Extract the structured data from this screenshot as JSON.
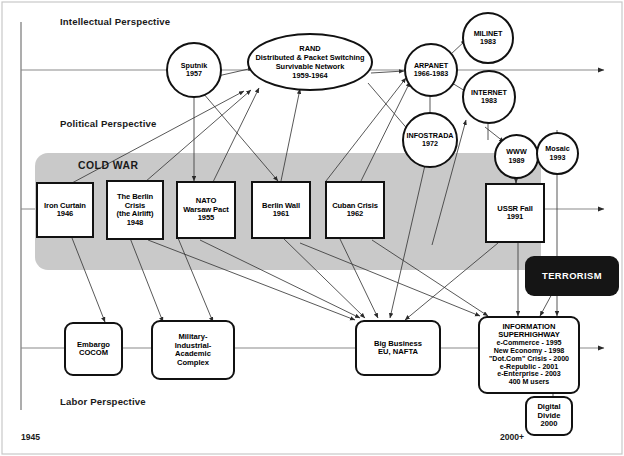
{
  "diagram": {
    "timeline_start": "1945",
    "timeline_end": "2000+",
    "band_label": "COLD WAR",
    "band_color": "#c9c9c9",
    "terrorism_color": "#151515"
  },
  "perspectives": [
    {
      "id": "intellectual",
      "label": "Intellectual Perspective"
    },
    {
      "id": "political",
      "label": "Political Perspective"
    },
    {
      "id": "labor",
      "label": "Labor Perspective"
    }
  ],
  "nodes": {
    "sputnik": {
      "lines": [
        "Sputnik",
        "1957"
      ]
    },
    "rand": {
      "lines": [
        "RAND",
        "Distributed & Packet Switching",
        "Survivable Network",
        "1959-1964"
      ]
    },
    "arpanet": {
      "lines": [
        "ARPANET",
        "1966-1983"
      ]
    },
    "milinet": {
      "lines": [
        "MILINET",
        "1983"
      ]
    },
    "internet": {
      "lines": [
        "INTERNET",
        "1983"
      ]
    },
    "infostrada": {
      "lines": [
        "INFOSTRADA",
        "1972"
      ]
    },
    "www": {
      "lines": [
        "WWW",
        "1989"
      ]
    },
    "mosaic": {
      "lines": [
        "Mosaic",
        "1993"
      ]
    },
    "iron_curtain": {
      "lines": [
        "Iron Curtain",
        "1946"
      ]
    },
    "berlin_crisis": {
      "lines": [
        "The Berlin",
        "Crisis",
        "(the Airlift)",
        "1948"
      ]
    },
    "nato": {
      "lines": [
        "NATO",
        "Warsaw Pact",
        "1955"
      ]
    },
    "berlin_wall": {
      "lines": [
        "Berlin Wall",
        "1961"
      ]
    },
    "cuban_crisis": {
      "lines": [
        "Cuban Crisis",
        "1962"
      ]
    },
    "ussr_fall": {
      "lines": [
        "USSR Fall",
        "1991"
      ]
    },
    "terrorism": {
      "lines": [
        "TERRORISM"
      ]
    },
    "embargo": {
      "lines": [
        "Embargo",
        "COCOM"
      ]
    },
    "mic": {
      "lines": [
        "Military-",
        "Industrial-",
        "Academic",
        "Complex"
      ]
    },
    "big_business": {
      "lines": [
        "Big Business",
        "EU, NAFTA"
      ]
    },
    "info_superhighway": {
      "lines": [
        "INFORMATION",
        "SUPERHIGHWAY",
        "e-Commerce - 1995",
        "New Economy - 1998",
        "\"Dot.Com\" Crisis - 2000",
        "e-Republic - 2001",
        "e-Enterprise - 2003",
        "400 M users"
      ]
    },
    "digital_divide": {
      "lines": [
        "Digital",
        "Divide",
        "2000"
      ]
    }
  }
}
